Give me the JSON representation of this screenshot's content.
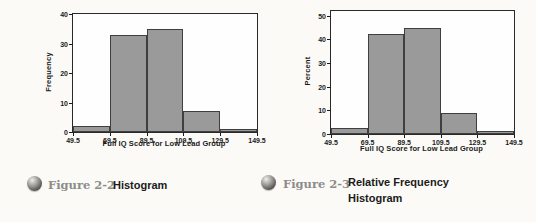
{
  "page": {
    "background": "#fbfaf7"
  },
  "figures": [
    {
      "figure_label": "Figure 2-2",
      "title_lines": [
        "Histogram"
      ],
      "icon": "sphere-icon"
    },
    {
      "figure_label": "Figure 2-3",
      "title_lines": [
        "Relative Frequency",
        "Histogram"
      ],
      "icon": "sphere-icon"
    }
  ],
  "chart_data": [
    {
      "type": "bar",
      "subtype": "histogram",
      "title": "",
      "xlabel": "Full IQ Score for Low Lead Group",
      "ylabel": "Frequency",
      "bin_edges": [
        49.5,
        69.5,
        89.5,
        109.5,
        129.5,
        149.5
      ],
      "x_tick_labels": [
        "49.5",
        "69.5",
        "89.5",
        "109.5",
        "129.5",
        "149.5"
      ],
      "values": [
        2,
        33,
        35,
        7,
        1
      ],
      "y_ticks": [
        0,
        10,
        20,
        30,
        40
      ],
      "ylim": [
        0,
        40
      ],
      "grid": false,
      "legend": "none",
      "bar_fill": "#9a9a9a",
      "bar_edge": "#3f3f3f"
    },
    {
      "type": "bar",
      "subtype": "histogram",
      "title": "",
      "xlabel": "Full IQ Score for Low Lead Group",
      "ylabel": "Percent",
      "bin_edges": [
        49.5,
        69.5,
        89.5,
        109.5,
        129.5,
        149.5
      ],
      "x_tick_labels": [
        "49.5",
        "69.5",
        "89.5",
        "109.5",
        "129.5",
        "149.5"
      ],
      "values": [
        2.6,
        42.3,
        44.9,
        9.0,
        1.3
      ],
      "y_ticks": [
        0,
        10,
        20,
        30,
        40,
        50
      ],
      "ylim": [
        0,
        52
      ],
      "grid": false,
      "legend": "none",
      "bar_fill": "#9a9a9a",
      "bar_edge": "#3f3f3f"
    }
  ]
}
